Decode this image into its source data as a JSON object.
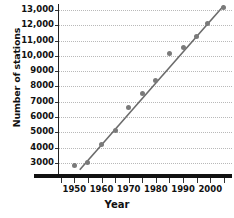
{
  "chart_data": {
    "type": "scatter",
    "title": "",
    "xlabel": "Year",
    "ylabel": "Number of stations",
    "xlim": [
      1944,
      2008
    ],
    "ylim": [
      2400,
      13400
    ],
    "grid": true,
    "legend": "none",
    "x_ticks": [
      1950,
      1960,
      1970,
      1980,
      1990,
      2000
    ],
    "x_tick_labels": [
      "1950",
      "1960",
      "1970",
      "1980",
      "1990",
      "2000"
    ],
    "x_minor_ticks": [
      1945,
      1955,
      1965,
      1975,
      1985,
      1995,
      2005
    ],
    "y_ticks": [
      3000,
      4000,
      5000,
      6000,
      7000,
      8000,
      9000,
      10000,
      11000,
      12000,
      13000
    ],
    "y_tick_labels": [
      "3000",
      "4000",
      "5000",
      "6000",
      "7000",
      "8000",
      "9000",
      "10,000",
      "11,000",
      "12,000",
      "13,000"
    ],
    "x": [
      1950,
      1955,
      1960,
      1965,
      1970,
      1975,
      1980,
      1985,
      1990,
      1995,
      1999,
      2005
    ],
    "values": [
      2800,
      3050,
      4200,
      5100,
      6650,
      7550,
      8400,
      10150,
      10550,
      11300,
      12100,
      13150
    ],
    "series": [
      {
        "name": "Number of stations",
        "marker": "circle",
        "color": "#7a7a7a",
        "points": [
          {
            "x": 1950,
            "y": 2800
          },
          {
            "x": 1955,
            "y": 3050
          },
          {
            "x": 1960,
            "y": 4200
          },
          {
            "x": 1965,
            "y": 5100
          },
          {
            "x": 1970,
            "y": 6650
          },
          {
            "x": 1975,
            "y": 7550
          },
          {
            "x": 1980,
            "y": 8400
          },
          {
            "x": 1985,
            "y": 10150
          },
          {
            "x": 1990,
            "y": 10550
          },
          {
            "x": 1995,
            "y": 11300
          },
          {
            "x": 1999,
            "y": 12100
          },
          {
            "x": 2005,
            "y": 13150
          }
        ]
      },
      {
        "name": "trend-line",
        "type": "line",
        "color": "#6b6b6b",
        "points": [
          {
            "x": 1952,
            "y": 2550
          },
          {
            "x": 2005,
            "y": 13300
          }
        ]
      }
    ],
    "colors": {
      "marker": "#7a7a7a",
      "trend": "#6b6b6b",
      "grid": "#b9b9b9",
      "axis": "#111111",
      "background": "#ffffff"
    }
  }
}
